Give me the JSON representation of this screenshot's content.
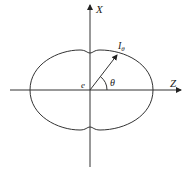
{
  "diagram": {
    "axes": {
      "vertical_label": "X",
      "horizontal_label": "Z"
    },
    "origin_label": "e",
    "vector_label": "I",
    "vector_subscript": "θ",
    "angle_label": "θ",
    "colors": {
      "stroke": "#333333",
      "background": "#ffffff"
    }
  }
}
